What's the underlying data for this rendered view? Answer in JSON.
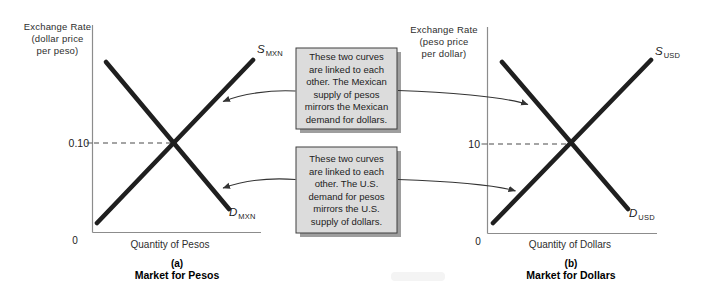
{
  "figure": {
    "panels": {
      "pesos": {
        "axis_title_lines": [
          "Exchange Rate",
          "(dollar price",
          "per peso)"
        ],
        "equilibrium_rate_label": "0.10",
        "origin_label": "0",
        "x_axis_label": "Quantity of Pesos",
        "supply": {
          "letter": "S",
          "sub": "MXN"
        },
        "demand": {
          "letter": "D",
          "sub": "MXN"
        },
        "caption_index": "(a)",
        "caption_title": "Market for Pesos"
      },
      "dollars": {
        "axis_title_lines": [
          "Exchange Rate",
          "(peso price",
          "per dollar)"
        ],
        "equilibrium_rate_label": "10",
        "origin_label": "0",
        "x_axis_label": "Quantity of Dollars",
        "supply": {
          "letter": "S",
          "sub": "USD"
        },
        "demand": {
          "letter": "D",
          "sub": "USD"
        },
        "caption_index": "(b)",
        "caption_title": "Market for Dollars"
      }
    },
    "notes": {
      "top": {
        "lines": [
          "These two curves",
          "are linked to each",
          "other. The Mexican",
          "supply of pesos",
          "mirrors the Mexican",
          "demand for dollars."
        ]
      },
      "bottom": {
        "lines": [
          "These two curves",
          "are linked to each",
          "other. The U.S.",
          "demand for pesos",
          "mirrors the U.S.",
          "supply of dollars."
        ]
      }
    },
    "colors": {
      "curve": "#1f1f1f",
      "axis": "#8c8c8c",
      "dashed_guide": "#4a4a4a",
      "arrow": "#333333",
      "note_fill": "#dcdcdc",
      "note_border": "#3f3f3f",
      "note_shadow": "#9e9e9e"
    }
  }
}
